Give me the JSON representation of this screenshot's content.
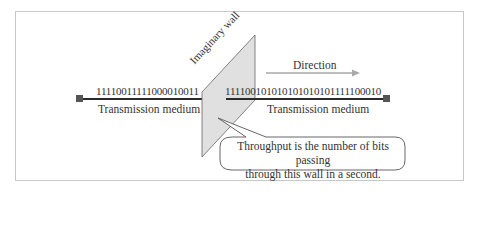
{
  "diagram": {
    "type": "throughput-illustration",
    "left_bits": "11110011111000010011",
    "right_bits": "111100101010101010101111100010",
    "left_medium_label": "Transmission medium",
    "right_medium_label": "Transmission medium",
    "wall_label": "Imaginary wall",
    "direction_label": "Direction",
    "callout": {
      "line1": "Throughput is the number of bits passing",
      "line2": "through this wall in a second."
    },
    "colors": {
      "line": "#2b2b2b",
      "endpoint": "#555555",
      "wall_fill": "#e0e0e0",
      "wall_stroke": "#666666",
      "arrow": "#a9a9a9",
      "frame": "#c8c8c8"
    }
  }
}
